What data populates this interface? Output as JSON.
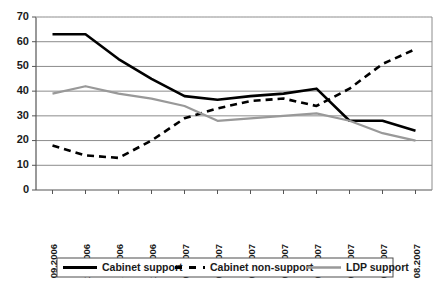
{
  "chart_data": {
    "type": "line",
    "title": "",
    "xlabel": "",
    "ylabel": "",
    "ylim": [
      0,
      70
    ],
    "ytick_step": 10,
    "yticks": [
      "0",
      "10",
      "20",
      "30",
      "40",
      "50",
      "60",
      "70"
    ],
    "grid": true,
    "legend_position": "bottom",
    "categories": [
      "09.2006",
      "10.2006",
      "11.2006",
      "12.2006",
      "01.2007",
      "02.2007",
      "03.2007",
      "04.2007",
      "05.2007",
      "06.2007",
      "07.2007",
      "08.2007"
    ],
    "series": [
      {
        "name": "Cabinet support",
        "style": "solid",
        "color": "#000000",
        "width": 2.6,
        "values": [
          63,
          63,
          53,
          45,
          38,
          36.5,
          38,
          39,
          41,
          28,
          28,
          24
        ]
      },
      {
        "name": "Cabinet non-support",
        "style": "dashed",
        "color": "#000000",
        "width": 2.6,
        "values": [
          18,
          14,
          13,
          20,
          29,
          33,
          36,
          37,
          34,
          41,
          51,
          57
        ]
      },
      {
        "name": "LDP support",
        "style": "solid",
        "color": "#999999",
        "width": 2.2,
        "values": [
          39,
          42,
          39,
          37,
          34,
          28,
          29,
          30,
          31,
          28,
          23,
          20
        ]
      }
    ]
  },
  "legend": {
    "items": [
      {
        "label": "Cabinet support",
        "marker": "solid-black-line"
      },
      {
        "label": "Cabinet non-support",
        "marker": "dashed-black-line"
      },
      {
        "label": "LDP support",
        "marker": "solid-gray-line"
      }
    ]
  }
}
